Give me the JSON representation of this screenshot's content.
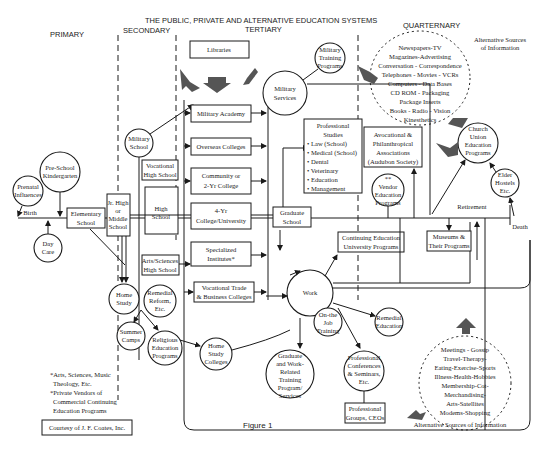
{
  "title": "THE PUBLIC, PRIVATE AND ALTERNATIVE EDUCATION SYSTEMS",
  "stages": {
    "primary": "PRIMARY",
    "secondary": "SECONDARY",
    "tertiary": "TERTIARY",
    "quarternary": "QUARTERNARY"
  },
  "lifeline": {
    "birth": "Birth",
    "retirement": "Retirement",
    "death": "Death"
  },
  "primary_nodes": {
    "prenatal": [
      "Prenatal",
      "Influences"
    ],
    "preschool": [
      "Pre-School",
      "Kindergarten"
    ],
    "daycare": [
      "Day",
      "Care"
    ],
    "elementary": [
      "Elementary",
      "School"
    ]
  },
  "secondary_nodes": {
    "jrhigh": [
      "Jr. High",
      "or",
      "Middle",
      "School"
    ],
    "military_school": [
      "Military",
      "School"
    ],
    "vocational_hs": [
      "Vocational",
      "High School"
    ],
    "high_school": [
      "High",
      "School"
    ],
    "arts_hs": [
      "Arts/Sciences",
      "High School"
    ],
    "home_study": [
      "Home",
      "Study"
    ],
    "remedial_reform": [
      "Remedial",
      "Reform,",
      "Etc."
    ],
    "summer_camps": [
      "Summer",
      "Camps"
    ],
    "religious": [
      "Religious",
      "Education",
      "Programs"
    ]
  },
  "tertiary_nodes": {
    "libraries": "Libraries",
    "military_academy": "Military Academy",
    "overseas": "Overseas Colleges",
    "community": [
      "Community or",
      "2-Yr College"
    ],
    "four_yr": [
      "4-Yr",
      "College/University"
    ],
    "specialized": [
      "Specialized",
      "Institutes*"
    ],
    "vocational_trade": [
      "Vocational Trade",
      "& Business Colleges"
    ],
    "home_study_colleges": [
      "Home",
      "Study",
      "Colleges"
    ],
    "military_services": [
      "Military",
      "Services"
    ],
    "military_training": [
      "Military",
      "Training",
      "Programs"
    ],
    "graduate_school": [
      "Graduate",
      "School"
    ],
    "professional_studies": {
      "title": [
        "Professional",
        "Studies"
      ],
      "items": [
        "• Law (School)",
        "• Medical (School)",
        "• Dental",
        "• Veterinary",
        "• Education",
        "• Management"
      ]
    },
    "continuing_ed": [
      "Continuing Education",
      "University Programs"
    ],
    "work": "Work",
    "ojt": [
      "On-the",
      "Job",
      "Training"
    ],
    "grad_work": [
      "Graduate",
      "and Work-",
      "Related",
      "Training",
      "Program/",
      "Services"
    ],
    "prof_conferences": [
      "Professional",
      "Conferences",
      "& Seminars,",
      "Etc."
    ],
    "prof_groups": [
      "Professional",
      "Groups, CEOs"
    ],
    "remedial_ed": [
      "Remedial",
      "Education"
    ]
  },
  "quarternary_nodes": {
    "avocational": [
      "Avocational &",
      "Philanthropical",
      "Associations",
      "(Audubon Society)"
    ],
    "vendor": [
      "**",
      "Vendor",
      "Education",
      "Programs"
    ],
    "church": [
      "Church",
      "Union",
      "Education",
      "Programs"
    ],
    "elder": [
      "Elder",
      "Hostels",
      "Etc."
    ],
    "museums": [
      "Museums &",
      "Their Programs"
    ]
  },
  "alt_sources_top": {
    "label": [
      "Alternative Sources",
      "of Information"
    ],
    "items": [
      "Newspapers-TV",
      "Magazines-Advertising",
      "Conversation - Correspondence",
      "Telephones - Movies - VCRs",
      "Computers - Data Bases",
      "CD ROM - Packaging",
      "Package Inserts",
      "Books - Radio - Vision",
      "Kinesthetics"
    ]
  },
  "alt_sources_bottom": {
    "label": "Alternative Sources of Information",
    "items": [
      "Meetings - Gossip",
      "Travel-Therapy-",
      "Eating-Exercise-Sports",
      "Illness-Health-Hobbies",
      "Membership-Cot-",
      "Merchandising-",
      "Arts-Satellites",
      "Modems-Shopping"
    ]
  },
  "footnotes": [
    "*Arts, Sciences, Music",
    "Theology, Etc.",
    "*Private Vendors of",
    "Commercial Continuing",
    "Education Programs"
  ],
  "courtesy": "Courtesy of J. F. Coates, Inc.",
  "figure_label": "Figure 1"
}
